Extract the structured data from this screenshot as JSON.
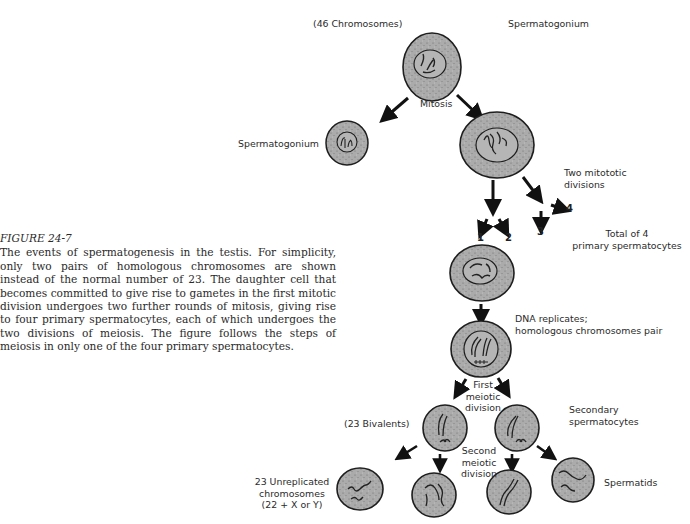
{
  "caption": {
    "figure_number": "FIGURE 24-7",
    "text": "The events of spermatogenesis in the testis. For simplicity, only two pairs of homologous chromosomes are shown instead of the normal number of 23. The daughter cell that becomes committed to give rise to gametes in the first mitotic division undergoes two further rounds of mitosis, giving rise to four primary spermatocytes, each of which undergoes the two divisions of meiosis. The figure follows the steps of meiosis in only one of the four primary spermatocytes."
  },
  "labels": {
    "chromosome_count": "(46 Chromosomes)",
    "spermatogonium_top": "Spermatogonium",
    "mitosis": "Mitosis",
    "spermatogonium_left": "Spermatogonium",
    "two_mitotic_divisions_line1": "Two mitototic",
    "two_mitotic_divisions_line2": "divisions",
    "total_line1": "Total of 4",
    "total_line2": "primary spermatocytes",
    "dna_replicates_line1": "DNA replicates;",
    "dna_replicates_line2": "homologous chromosomes pair",
    "first_meiotic_line1": "First",
    "first_meiotic_line2": "meiotic",
    "first_meiotic_line3": "division",
    "bivalents": "(23 Bivalents)",
    "secondary_line1": "Secondary",
    "secondary_line2": "spermatocytes",
    "second_meiotic_line1": "Second",
    "second_meiotic_line2": "meiotic",
    "second_meiotic_line3": "division",
    "unreplicated_line1": "23 Unreplicated",
    "unreplicated_line2": "chromosomes",
    "unreplicated_line3": "(22 + X or Y)",
    "spermatids": "Spermatids"
  },
  "numbers": {
    "n1": "1",
    "n2": "2",
    "n3": "3",
    "n4": "4"
  },
  "colors": {
    "cell_fill": "#a9a9a9",
    "cell_stroke": "#1e1e1e",
    "nucleus_fill": "#b8b8b8",
    "arrow": "#111111",
    "text": "#2b2b2b"
  }
}
